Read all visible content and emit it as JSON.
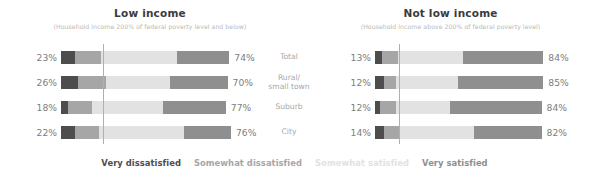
{
  "chart_data": {
    "type": "bar",
    "subtype": "diverging-stacked-bar",
    "title": "",
    "xlabel": "",
    "ylabel": "",
    "grid": false,
    "legend_position": "bottom",
    "categories": [
      "Total",
      "Rural/\nsmall town",
      "Suburb",
      "City"
    ],
    "legend": [
      {
        "name": "Very dissatisfied",
        "color": "#4d4d4d"
      },
      {
        "name": "Somewhat dissatisfied",
        "color": "#a6a6a6"
      },
      {
        "name": "Somewhat satisfied",
        "color": "#e2e2e2"
      },
      {
        "name": "Very satisfied",
        "color": "#8f8f8f"
      }
    ],
    "panels": [
      {
        "title": "Low income",
        "subtitle": "(Household income 200% of federal poverty level and below)",
        "rows": [
          {
            "category": "Total",
            "left_label": "23%",
            "right_label": "74%",
            "values": [
              8,
              15,
              44,
              30
            ],
            "dissatisfied_total": 23,
            "satisfied_total": 74
          },
          {
            "category": "Rural/small town",
            "left_label": "26%",
            "right_label": "70%",
            "values": [
              10,
              16,
              37,
              33
            ],
            "dissatisfied_total": 26,
            "satisfied_total": 70
          },
          {
            "category": "Suburb",
            "left_label": "18%",
            "right_label": "77%",
            "values": [
              4,
              14,
              41,
              36
            ],
            "dissatisfied_total": 18,
            "satisfied_total": 77
          },
          {
            "category": "City",
            "left_label": "22%",
            "right_label": "76%",
            "values": [
              8,
              14,
              49,
              27
            ],
            "dissatisfied_total": 22,
            "satisfied_total": 76
          }
        ]
      },
      {
        "title": "Not low income",
        "subtitle": "(Household income above 200% of federal poverty level)",
        "rows": [
          {
            "category": "Total",
            "left_label": "13%",
            "right_label": "84%",
            "values": [
              4,
              9,
              38,
              46
            ],
            "dissatisfied_total": 13,
            "satisfied_total": 84
          },
          {
            "category": "Rural/small town",
            "left_label": "12%",
            "right_label": "85%",
            "values": [
              5,
              7,
              36,
              49
            ],
            "dissatisfied_total": 12,
            "satisfied_total": 85
          },
          {
            "category": "Suburb",
            "left_label": "12%",
            "right_label": "84%",
            "values": [
              3,
              9,
              31,
              53
            ],
            "dissatisfied_total": 12,
            "satisfied_total": 84
          },
          {
            "category": "City",
            "left_label": "14%",
            "right_label": "82%",
            "values": [
              5,
              9,
              43,
              39
            ],
            "dissatisfied_total": 14,
            "satisfied_total": 82
          }
        ]
      }
    ]
  },
  "panels": {
    "left": {
      "title": "Low income",
      "subtitle": "(Household income 200% of federal poverty level and below)"
    },
    "right": {
      "title": "Not low income",
      "subtitle": "(Household income above 200% of federal poverty level)"
    }
  },
  "categories": {
    "total": "Total",
    "rural_line1": "Rural/",
    "rural_line2": "small town",
    "suburb": "Suburb",
    "city": "City"
  },
  "legend": {
    "very_dissatisfied": "Very dissatisfied",
    "somewhat_dissatisfied": "Somewhat dissatisfied",
    "somewhat_satisfied": "Somewhat satisfied",
    "very_satisfied": "Very satisfied"
  },
  "colors": {
    "very_dissatisfied": "#4d4d4d",
    "somewhat_dissatisfied": "#a6a6a6",
    "somewhat_satisfied": "#e2e2e2",
    "very_satisfied": "#8f8f8f",
    "refline": "#b0b0b0",
    "title": "#3b3b3b",
    "subtitle": "#b9b9b9",
    "pct_label": "#7d7d7d",
    "category_label": "#a8a8a8"
  }
}
